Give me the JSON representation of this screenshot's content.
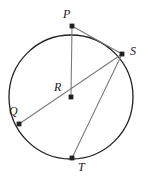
{
  "figure": {
    "kind": "circle-geometry-diagram",
    "width": 151,
    "height": 182,
    "background_color": "#ffffff",
    "stroke_color": "#231f20",
    "chord_color": "#6d6e71",
    "point_color": "#231f20"
  },
  "circle": {
    "name": "circle-R",
    "center_x": 71,
    "center_y": 97,
    "radius": 62,
    "stroke_width": 1.3
  },
  "points": [
    {
      "id": "P",
      "label": "P",
      "x": 72,
      "y": 26,
      "label_x": 63,
      "label_y": 8,
      "on_circle": true
    },
    {
      "id": "S",
      "label": "S",
      "x": 122,
      "y": 54,
      "label_x": 130,
      "label_y": 45,
      "on_circle": true
    },
    {
      "id": "R",
      "label": "R",
      "x": 71,
      "y": 97,
      "label_x": 54,
      "label_y": 81,
      "on_circle": false
    },
    {
      "id": "Q",
      "label": "Q",
      "x": 19,
      "y": 124,
      "label_x": 9,
      "label_y": 105,
      "on_circle": true
    },
    {
      "id": "T",
      "label": "T",
      "x": 72,
      "y": 158,
      "label_x": 78,
      "label_y": 161,
      "on_circle": true
    }
  ],
  "segments": [
    {
      "name": "segment-P-R",
      "from": "P",
      "to": "R",
      "kind": "radius"
    },
    {
      "name": "segment-P-S",
      "from": "P",
      "to": "S",
      "kind": "chord"
    },
    {
      "name": "segment-Q-S",
      "from": "Q",
      "to": "S",
      "kind": "diameter"
    },
    {
      "name": "segment-S-T",
      "from": "S",
      "to": "T",
      "kind": "chord"
    }
  ],
  "point_marker": {
    "size": 2.4
  }
}
